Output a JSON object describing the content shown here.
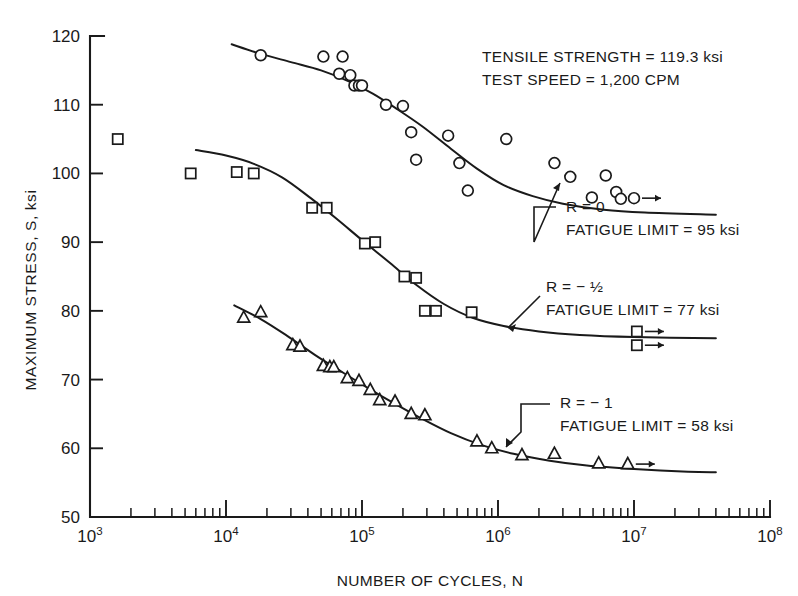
{
  "chart_data": {
    "type": "scatter",
    "title": "",
    "xlabel": "NUMBER OF CYCLES, N",
    "ylabel": "MAXIMUM STRESS, S, ksi",
    "xscale": "log",
    "xlim": [
      1000,
      100000000
    ],
    "ylim": [
      50,
      120
    ],
    "grid": false,
    "legend_position": "none",
    "x_tick_labels": [
      "10^3",
      "10^4",
      "10^5",
      "10^6",
      "10^7",
      "10^8"
    ],
    "x_tick_values": [
      1000,
      10000,
      100000,
      1000000,
      10000000,
      100000000
    ],
    "y_tick_labels": [
      "50",
      "60",
      "70",
      "80",
      "90",
      "100",
      "110",
      "120"
    ],
    "y_tick_values": [
      50,
      60,
      70,
      80,
      90,
      100,
      110,
      120
    ],
    "series": [
      {
        "name": "R = 0",
        "marker": "circle",
        "fatigue_limit": 95,
        "points": [
          {
            "x": 18000,
            "y": 117.2
          },
          {
            "x": 52000,
            "y": 117.0
          },
          {
            "x": 72000,
            "y": 117.0
          },
          {
            "x": 68000,
            "y": 114.5
          },
          {
            "x": 82000,
            "y": 114.3
          },
          {
            "x": 88000,
            "y": 112.8
          },
          {
            "x": 95000,
            "y": 112.8
          },
          {
            "x": 100000,
            "y": 112.8
          },
          {
            "x": 150000,
            "y": 110.0
          },
          {
            "x": 200000,
            "y": 109.8
          },
          {
            "x": 230000,
            "y": 106.0
          },
          {
            "x": 250000,
            "y": 102.0
          },
          {
            "x": 430000,
            "y": 105.5
          },
          {
            "x": 520000,
            "y": 101.5
          },
          {
            "x": 600000,
            "y": 97.5
          },
          {
            "x": 1150000,
            "y": 105.0
          },
          {
            "x": 2600000,
            "y": 101.5
          },
          {
            "x": 3400000,
            "y": 99.5
          },
          {
            "x": 4900000,
            "y": 96.5
          },
          {
            "x": 6200000,
            "y": 99.7
          },
          {
            "x": 7400000,
            "y": 97.3
          },
          {
            "x": 8000000,
            "y": 96.3
          },
          {
            "x": 10000000,
            "y": 96.4,
            "runout": true
          }
        ]
      },
      {
        "name": "R = -1/2",
        "marker": "square",
        "fatigue_limit": 77,
        "points": [
          {
            "x": 1600,
            "y": 105.0
          },
          {
            "x": 5500,
            "y": 100.0
          },
          {
            "x": 12000,
            "y": 100.2
          },
          {
            "x": 16000,
            "y": 100.0
          },
          {
            "x": 43000,
            "y": 95.0
          },
          {
            "x": 55000,
            "y": 95.0
          },
          {
            "x": 105000,
            "y": 89.8
          },
          {
            "x": 125000,
            "y": 90.0
          },
          {
            "x": 205000,
            "y": 85.0
          },
          {
            "x": 250000,
            "y": 84.8
          },
          {
            "x": 290000,
            "y": 80.0
          },
          {
            "x": 350000,
            "y": 80.0
          },
          {
            "x": 640000,
            "y": 79.8
          },
          {
            "x": 10500000,
            "y": 77.0,
            "runout": true
          },
          {
            "x": 10500000,
            "y": 75.0,
            "runout": true
          }
        ]
      },
      {
        "name": "R = -1",
        "marker": "triangle",
        "fatigue_limit": 58,
        "points": [
          {
            "x": 13500,
            "y": 79.0
          },
          {
            "x": 18000,
            "y": 79.8
          },
          {
            "x": 31000,
            "y": 75.0
          },
          {
            "x": 35000,
            "y": 74.8
          },
          {
            "x": 52000,
            "y": 72.0
          },
          {
            "x": 58000,
            "y": 71.8
          },
          {
            "x": 62000,
            "y": 71.8
          },
          {
            "x": 78000,
            "y": 70.2
          },
          {
            "x": 95000,
            "y": 69.8
          },
          {
            "x": 115000,
            "y": 68.5
          },
          {
            "x": 135000,
            "y": 67.0
          },
          {
            "x": 175000,
            "y": 66.8
          },
          {
            "x": 230000,
            "y": 65.0
          },
          {
            "x": 290000,
            "y": 64.8
          },
          {
            "x": 700000,
            "y": 61.0
          },
          {
            "x": 900000,
            "y": 60.0
          },
          {
            "x": 1500000,
            "y": 59.0
          },
          {
            "x": 2600000,
            "y": 59.2
          },
          {
            "x": 5500000,
            "y": 57.8
          },
          {
            "x": 9000000,
            "y": 57.7,
            "runout": true
          }
        ]
      }
    ],
    "curves": [
      {
        "name": "R = 0",
        "points": [
          {
            "x": 11000,
            "y": 118.8
          },
          {
            "x": 18000,
            "y": 117.4
          },
          {
            "x": 30000,
            "y": 116.2
          },
          {
            "x": 50000,
            "y": 115.0
          },
          {
            "x": 80000,
            "y": 113.4
          },
          {
            "x": 120000,
            "y": 111.6
          },
          {
            "x": 180000,
            "y": 109.4
          },
          {
            "x": 280000,
            "y": 106.8
          },
          {
            "x": 450000,
            "y": 103.6
          },
          {
            "x": 700000,
            "y": 100.7
          },
          {
            "x": 1100000,
            "y": 98.3
          },
          {
            "x": 1800000,
            "y": 96.7
          },
          {
            "x": 3000000,
            "y": 95.6
          },
          {
            "x": 6000000,
            "y": 94.7
          },
          {
            "x": 12000000,
            "y": 94.3
          },
          {
            "x": 40000000,
            "y": 94.0
          }
        ]
      },
      {
        "name": "R = -1/2",
        "points": [
          {
            "x": 6000,
            "y": 103.4
          },
          {
            "x": 10000,
            "y": 102.6
          },
          {
            "x": 16000,
            "y": 101.4
          },
          {
            "x": 26000,
            "y": 99.4
          },
          {
            "x": 42000,
            "y": 96.4
          },
          {
            "x": 65000,
            "y": 93.4
          },
          {
            "x": 100000,
            "y": 90.3
          },
          {
            "x": 160000,
            "y": 87.0
          },
          {
            "x": 250000,
            "y": 83.8
          },
          {
            "x": 400000,
            "y": 81.0
          },
          {
            "x": 650000,
            "y": 79.0
          },
          {
            "x": 1100000,
            "y": 77.8
          },
          {
            "x": 2000000,
            "y": 77.0
          },
          {
            "x": 4000000,
            "y": 76.5
          },
          {
            "x": 10000000,
            "y": 76.2
          },
          {
            "x": 40000000,
            "y": 76.0
          }
        ]
      },
      {
        "name": "R = -1",
        "points": [
          {
            "x": 11500,
            "y": 80.8
          },
          {
            "x": 18000,
            "y": 78.8
          },
          {
            "x": 28000,
            "y": 76.4
          },
          {
            "x": 45000,
            "y": 73.6
          },
          {
            "x": 70000,
            "y": 71.2
          },
          {
            "x": 110000,
            "y": 68.8
          },
          {
            "x": 170000,
            "y": 66.6
          },
          {
            "x": 270000,
            "y": 64.4
          },
          {
            "x": 450000,
            "y": 62.2
          },
          {
            "x": 750000,
            "y": 60.5
          },
          {
            "x": 1300000,
            "y": 59.2
          },
          {
            "x": 2400000,
            "y": 58.2
          },
          {
            "x": 4500000,
            "y": 57.5
          },
          {
            "x": 10000000,
            "y": 57.0
          },
          {
            "x": 25000000,
            "y": 56.6
          },
          {
            "x": 40000000,
            "y": 56.5
          }
        ]
      }
    ]
  },
  "header_notes": [
    "TENSILE STRENGTH = 119.3 ksi",
    "TEST SPEED = 1,200 CPM"
  ],
  "annotations": [
    {
      "id": "r0",
      "lines": [
        "R = 0",
        "FATIGUE LIMIT = 95 ksi"
      ],
      "text_x": 566,
      "text_y": 212,
      "leader": "M 556 207 L 534 207 L 534 242 L 560 183"
    },
    {
      "id": "r-half",
      "lines": [
        "R = − ½",
        "FATIGUE LIMIT = 77 ksi"
      ],
      "text_x": 546,
      "text_y": 292,
      "leader": "M 540 296 L 508 328"
    },
    {
      "id": "r-minus1",
      "lines": [
        "R = − 1",
        "FATIGUE LIMIT = 58 ksi"
      ],
      "text_x": 560,
      "text_y": 408,
      "leader": "M 550 404 L 521 404 L 521 432 L 506 447"
    }
  ],
  "colors": {
    "ink": "#1a1a1a",
    "background": "#ffffff"
  }
}
